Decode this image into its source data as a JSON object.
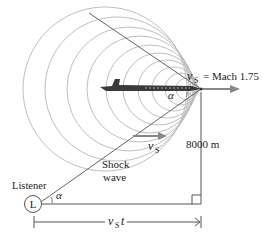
{
  "diagram": {
    "type": "supersonic-shock-wave",
    "labels": {
      "speed_symbol": "v",
      "speed_subscript": "S",
      "speed_value": "= Mach 1.75",
      "angle": "α",
      "altitude": "8000 m",
      "shock_line1": "Shock",
      "shock_line2": "wave",
      "listener": "Listener",
      "listener_marker": "L",
      "distance_symbol": "v",
      "distance_subscript": "S",
      "distance_suffix": "t"
    },
    "colors": {
      "wavefront": "#b5b5b5",
      "lines": "#555555",
      "arrow": "#888888",
      "plane": "#333333"
    }
  }
}
